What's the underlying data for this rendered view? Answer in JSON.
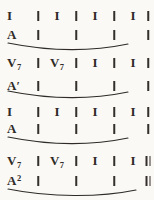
{
  "page": {
    "paper_color": "#faf9f6",
    "ink_color": "#2e2b28"
  },
  "systems": [
    {
      "rows": [
        {
          "kind": "harmony",
          "slur": false,
          "cells": [
            {
              "t": "sym",
              "v": "I"
            },
            {
              "t": "bar"
            },
            {
              "t": "sym",
              "v": "I"
            },
            {
              "t": "bar"
            },
            {
              "t": "sym",
              "v": "I"
            },
            {
              "t": "bar"
            },
            {
              "t": "sym",
              "v": "I"
            },
            {
              "t": "bar"
            }
          ]
        },
        {
          "kind": "phrase",
          "slur": true,
          "cells": [
            {
              "t": "sym",
              "v": "A"
            },
            {
              "t": "bar"
            },
            {
              "t": "none"
            },
            {
              "t": "bar"
            },
            {
              "t": "none"
            },
            {
              "t": "bar"
            },
            {
              "t": "none"
            },
            {
              "t": "bar"
            }
          ]
        }
      ]
    },
    {
      "rows": [
        {
          "kind": "harmony",
          "slur": false,
          "cells": [
            {
              "t": "sym",
              "v": "V",
              "sub": "7"
            },
            {
              "t": "bar"
            },
            {
              "t": "sym",
              "v": "V",
              "sub": "7"
            },
            {
              "t": "bar"
            },
            {
              "t": "sym",
              "v": "I"
            },
            {
              "t": "bar"
            },
            {
              "t": "sym",
              "v": "I"
            },
            {
              "t": "bar"
            }
          ]
        },
        {
          "kind": "phrase",
          "slur": true,
          "cells": [
            {
              "t": "sym",
              "v": "A",
              "prime": "′"
            },
            {
              "t": "bar"
            },
            {
              "t": "none"
            },
            {
              "t": "bar"
            },
            {
              "t": "none"
            },
            {
              "t": "bar"
            },
            {
              "t": "none"
            },
            {
              "t": "bar"
            }
          ]
        }
      ]
    },
    {
      "rows": [
        {
          "kind": "harmony",
          "slur": false,
          "cells": [
            {
              "t": "sym",
              "v": "I"
            },
            {
              "t": "bar"
            },
            {
              "t": "sym",
              "v": "I"
            },
            {
              "t": "bar"
            },
            {
              "t": "sym",
              "v": "I"
            },
            {
              "t": "bar"
            },
            {
              "t": "sym",
              "v": "I"
            },
            {
              "t": "bar"
            }
          ]
        },
        {
          "kind": "phrase",
          "slur": true,
          "cells": [
            {
              "t": "sym",
              "v": "A"
            },
            {
              "t": "bar"
            },
            {
              "t": "none"
            },
            {
              "t": "bar"
            },
            {
              "t": "none"
            },
            {
              "t": "bar"
            },
            {
              "t": "none"
            },
            {
              "t": "bar"
            }
          ]
        }
      ]
    },
    {
      "rows": [
        {
          "kind": "harmony",
          "slur": false,
          "cells": [
            {
              "t": "sym",
              "v": "V",
              "sub": "7"
            },
            {
              "t": "bar"
            },
            {
              "t": "sym",
              "v": "V",
              "sub": "7"
            },
            {
              "t": "bar"
            },
            {
              "t": "sym",
              "v": "I"
            },
            {
              "t": "bar"
            },
            {
              "t": "sym",
              "v": "I"
            },
            {
              "t": "dbar"
            }
          ]
        },
        {
          "kind": "phrase",
          "slur": true,
          "cells": [
            {
              "t": "sym",
              "v": "A",
              "sup": "2"
            },
            {
              "t": "bar"
            },
            {
              "t": "none"
            },
            {
              "t": "bar"
            },
            {
              "t": "none"
            },
            {
              "t": "bar"
            },
            {
              "t": "none"
            },
            {
              "t": "dbar"
            }
          ]
        }
      ]
    }
  ]
}
